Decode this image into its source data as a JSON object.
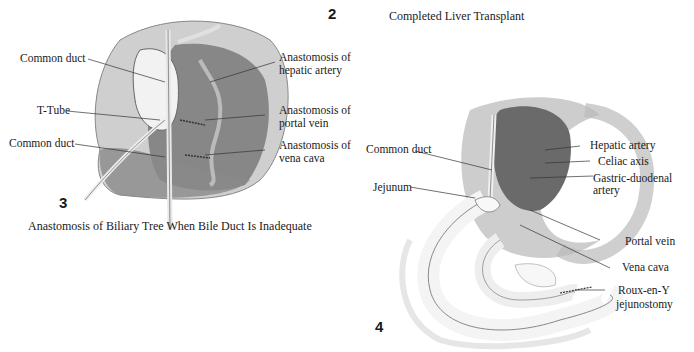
{
  "figure_2": {
    "number": "2",
    "caption": "Completed Liver Transplant"
  },
  "figure_3": {
    "number": "3",
    "caption": "Anastomosis of Biliary Tree When Bile Duct Is Inadequate",
    "labels": {
      "common_duct_top": "Common duct",
      "t_tube": "T-Tube",
      "common_duct_bottom": "Common duct",
      "hepatic_artery_1": "Anastomosis of",
      "hepatic_artery_2": "hepatic artery",
      "portal_vein_1": "Anastomosis of",
      "portal_vein_2": "portal vein",
      "vena_cava_1": "Anastomosis of",
      "vena_cava_2": "vena cava"
    }
  },
  "figure_4": {
    "number": "4",
    "labels": {
      "common_duct": "Common duct",
      "jejunum": "Jejunum",
      "hepatic_artery": "Hepatic artery",
      "celiac_axis": "Celiac axis",
      "gastric_duodenal_1": "Gastric-duodenal",
      "gastric_duodenal_2": "artery",
      "portal_vein": "Portal vein",
      "vena_cava": "Vena cava",
      "roux_1": "Roux-en-Y",
      "roux_2": "jejunostomy"
    }
  },
  "colors": {
    "tissue_light": "#d9d9d9",
    "tissue_mid": "#9a9a9a",
    "tissue_dark": "#5a5a5a",
    "leader_line": "#333333"
  }
}
